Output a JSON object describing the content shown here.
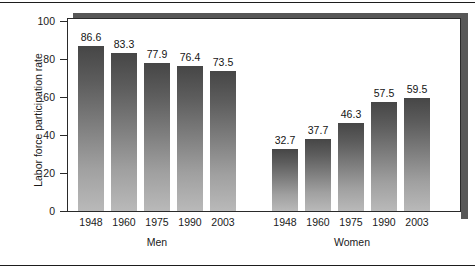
{
  "chart_data": {
    "type": "bar",
    "title": "",
    "xlabel": "",
    "ylabel": "Labor force participation rate",
    "ylim": [
      0,
      100
    ],
    "yticks": [
      0,
      20,
      40,
      60,
      80,
      100
    ],
    "grid": false,
    "legend": "none",
    "categories": [
      "1948",
      "1960",
      "1975",
      "1990",
      "2003"
    ],
    "groups": [
      {
        "name": "Men",
        "categories": [
          "1948",
          "1960",
          "1975",
          "1990",
          "2003"
        ],
        "values": [
          86.6,
          83.3,
          77.9,
          76.4,
          73.5
        ],
        "value_labels": [
          "86.6",
          "83.3",
          "77.9",
          "76.4",
          "73.5"
        ]
      },
      {
        "name": "Women",
        "categories": [
          "1948",
          "1960",
          "1975",
          "1990",
          "2003"
        ],
        "values": [
          32.7,
          37.7,
          46.3,
          57.5,
          59.5
        ],
        "value_labels": [
          "32.7",
          "37.7",
          "46.3",
          "57.5",
          "59.5"
        ]
      }
    ],
    "series": [
      {
        "name": "Men",
        "values": [
          86.6,
          83.3,
          77.9,
          76.4,
          73.5
        ]
      },
      {
        "name": "Women",
        "values": [
          32.7,
          37.7,
          46.3,
          57.5,
          59.5
        ]
      }
    ],
    "colors": {
      "bar_top": "#464646",
      "bar_bottom": "#b9b9b9",
      "frame": "#2a2a2a",
      "shadow": "#575757",
      "text": "#1a1a1a",
      "background": "#ffffff"
    }
  },
  "axis": {
    "y_title": "Labor force participation rate",
    "y_tick_labels": [
      "100",
      "80",
      "60",
      "40",
      "20",
      "0"
    ]
  },
  "groups": {
    "men_label": "Men",
    "women_label": "Women"
  }
}
